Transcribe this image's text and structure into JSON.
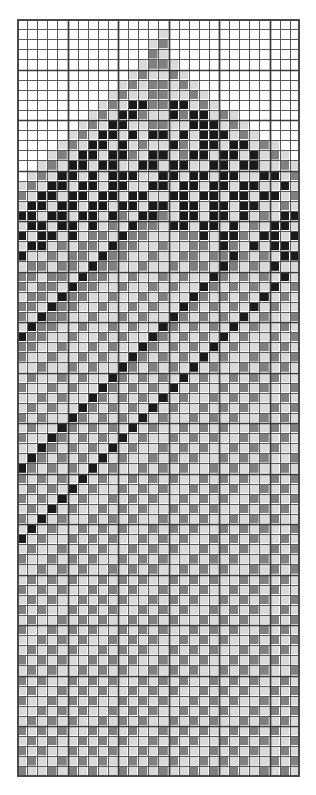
{
  "document": {
    "type": "cross-stitch-pattern-chart",
    "title": "Beaded Pattern Chart",
    "description": "Monochrome four-value gridded bead/cross-stitch pattern depicting a stylized figure with a pointed crown, a central round medallion, and spiral scroll motifs."
  },
  "chart_data": {
    "type": "heatmap",
    "title": "",
    "xlabel": "",
    "ylabel": "",
    "columns": 28,
    "rows": 75,
    "cell_size_px": 10.1,
    "grid": true,
    "grid_origin": {
      "x": 17,
      "y": 19
    },
    "heavy_line_every": 5,
    "legend_position": "none",
    "palette": {
      "0": {
        "name": "empty",
        "hex": "#ffffff"
      },
      "1": {
        "name": "light-gray",
        "hex": "#d9d9d9"
      },
      "2": {
        "name": "medium-gray",
        "hex": "#808080"
      },
      "3": {
        "name": "black",
        "hex": "#1a1a1a"
      }
    },
    "colors": [
      "#ffffff",
      "#d9d9d9",
      "#808080",
      "#1a1a1a"
    ],
    "grid_line_color": "#59595c",
    "heavy_line_color": "#3a3a3c",
    "border_color": "#4a4a4c",
    "values": [
      "0000000000000000000000000000",
      "0000000000000010000000000000",
      "0000000000000120000000000000",
      "0000000000000210000000000000",
      "0000000000001221000000000000",
      "0000000000012112100000000000",
      "0000000000121221210000000000",
      "0000000001211221121000000000",
      "0000000012133223312100000000",
      "0000000121332113233121000000",
      "0000001213311221133312100000",
      "0000012133131331313331210000",
      "0000121331312113213313312100",
      "0001213313321331233133131210",
      "0012133133113313311331331121",
      "0121331313331133133133113312",
      "1213313313311331331331331131",
      "2133133133133113313313313312",
      "1331331331331331331331331121",
      "3313313313213321331331312133",
      "1331331312132213313313121331",
      "3133131221322111223133213313",
      "1331212213221121122132131331",
      "3112122132211211221223212133",
      "1221221322112112122132121311",
      "2212213221121121211321212131",
      "2122132211211212113212121312",
      "1221322112112121132121213121",
      "2213221121121211321212131211",
      "2132211211212113212121312112",
      "1322112112121132121213121121",
      "3221121121211321212131211212",
      "2211211212113212121312112121",
      "2112112121132121213121121212",
      "1121121211321212131211212121",
      "1211212113212121312112121211",
      "2112121132121213121121212112",
      "1121211321212131211212121121",
      "1212113212121312112121211212",
      "2121132121213121121212112121",
      "1211321212131211212121121212",
      "2113212121312112121211212121",
      "1132121213121121212112121211",
      "1321212131211212121121212112",
      "3212121312112121211212121121",
      "2121213121121212112121211212",
      "1212131211212121121212112121",
      "2121312112121211212121121212",
      "1213121121212112121211212121",
      "2131211212121121212112121211",
      "1312112121211212121121212112",
      "3121121212112121211212121121",
      "1211212121121212112121211212",
      "2112121211212121121212112121",
      "1121212112121211212121121212",
      "1212121121212112121211212121",
      "2121211212121121212112121211",
      "1212112121211212121121212112",
      "2121121212112121211212121121",
      "1211212121121212112121211212",
      "2112121211212121121212112121",
      "1121212112121211212121121212",
      "1212121121212112121211212121",
      "2121211212121121212112121211",
      "1212112121211212121121212112",
      "2121121212112121211212121121",
      "1211212121121212112121211212",
      "2112121211212121121212112121",
      "1121212112121211212121121212",
      "1212121121212112121211212121",
      "2121211212121121212112121211",
      "1212112121211212121121212112",
      "2121121212112121211212121121",
      "1211212121121212112121211212",
      "2112121211212121121212112121"
    ],
    "motifs": [
      {
        "name": "pointed-crown",
        "rows": [
          1,
          12
        ],
        "cols": [
          9,
          19
        ]
      },
      {
        "name": "scroll-eyes",
        "rows": [
          8,
          16
        ],
        "cols": [
          6,
          22
        ]
      },
      {
        "name": "round-medallion",
        "rows": [
          24,
          40
        ],
        "cols": [
          8,
          21
        ]
      },
      {
        "name": "left-spiral-upper",
        "rows": [
          43,
          52
        ],
        "cols": [
          0,
          8
        ]
      },
      {
        "name": "left-spiral-lower",
        "rows": [
          53,
          60
        ],
        "cols": [
          0,
          9
        ]
      },
      {
        "name": "right-creature-eye",
        "rows": [
          51,
          52
        ],
        "cols": [
          24,
          25
        ]
      },
      {
        "name": "bottom-small-spiral",
        "rows": [
          62,
          67
        ],
        "cols": [
          1,
          7
        ]
      }
    ]
  }
}
